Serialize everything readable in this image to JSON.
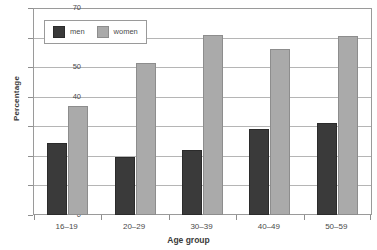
{
  "chart_data": {
    "type": "bar",
    "title": "",
    "xlabel": "Age group",
    "ylabel": "Percentage",
    "categories": [
      "16–19",
      "20–29",
      "30–39",
      "40–49",
      "50–59"
    ],
    "series": [
      {
        "name": "men",
        "color": "#3a3a3a",
        "values": [
          24.5,
          19.5,
          22,
          29,
          31
        ]
      },
      {
        "name": "women",
        "color": "#aaaaaa",
        "values": [
          37,
          51.5,
          61,
          56,
          60.5
        ]
      }
    ],
    "ylim": [
      0,
      70
    ],
    "ytick_step": 10,
    "yticks": [
      0,
      10,
      20,
      30,
      40,
      50,
      60,
      70
    ],
    "ytick_labels": [
      "0",
      "10",
      "20",
      "30",
      "40",
      "50",
      "60",
      "70"
    ],
    "grid": true,
    "grid_axis": "y",
    "legend_position": "top-left",
    "frame_color": "#9a9a9a",
    "gridline_color": "#b5b5b5",
    "background": "#ffffff"
  },
  "legend": {
    "items": [
      {
        "label": "men"
      },
      {
        "label": "women"
      }
    ]
  },
  "axes": {
    "y_title": "Percentage",
    "x_title": "Age group"
  }
}
